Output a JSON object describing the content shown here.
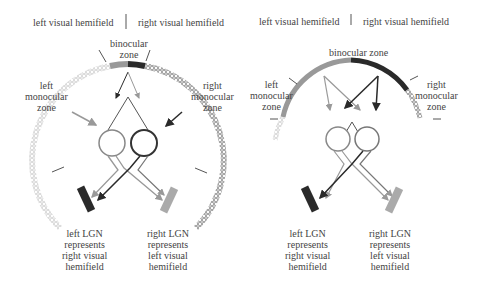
{
  "left_panel": {
    "header_left": "left visual hemifield",
    "header_right": "right visual hemifield",
    "binocular_zone": [
      "binocular",
      "zone"
    ],
    "left_monocular": [
      "left",
      "monocular",
      "zone"
    ],
    "right_monocular": [
      "right",
      "monocular",
      "zone"
    ],
    "left_lgn": [
      "left LGN",
      "represents",
      "right visual",
      "hemifield"
    ],
    "right_lgn": [
      "right LGN",
      "represents",
      "left visual",
      "hemifield"
    ]
  },
  "right_panel": {
    "header_left": "left visual hemifield",
    "header_right": "right visual hemifield",
    "binocular_zone": "binocular zone",
    "left_monocular": [
      "left",
      "monocular",
      "zone"
    ],
    "right_monocular": [
      "right",
      "monocular",
      "zone"
    ],
    "left_lgn": [
      "left LGN",
      "represents",
      "right visual",
      "hemifield"
    ],
    "right_lgn": [
      "right LGN",
      "represents",
      "left visual",
      "hemifield"
    ]
  },
  "colors": {
    "dark": "#2a2a2a",
    "light": "#9a9a9a",
    "text": "#444444"
  }
}
